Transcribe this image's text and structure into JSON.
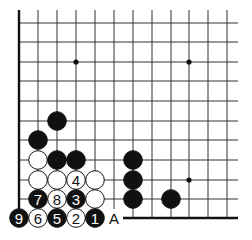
{
  "diagram": {
    "type": "go-board-corner",
    "grid": {
      "x": [
        19,
        38,
        57,
        76,
        95,
        114,
        133,
        152,
        171,
        189,
        208,
        227
      ],
      "y": [
        23,
        42,
        62,
        81,
        101,
        121,
        140,
        160,
        180,
        199,
        218
      ],
      "right_extent": 238,
      "top_extent": 10,
      "left_edge": true,
      "bottom_edge_from_x": 123
    },
    "hoshi": [
      {
        "col": 3,
        "row": 2
      },
      {
        "col": 9,
        "row": 2
      },
      {
        "col": 9,
        "row": 8
      }
    ],
    "stones": [
      {
        "col": 2,
        "row": 5,
        "color": "black",
        "label": ""
      },
      {
        "col": 1,
        "row": 6,
        "color": "black",
        "label": ""
      },
      {
        "col": 1,
        "row": 7,
        "color": "white",
        "label": ""
      },
      {
        "col": 2,
        "row": 7,
        "color": "black",
        "label": ""
      },
      {
        "col": 3,
        "row": 7,
        "color": "black",
        "label": ""
      },
      {
        "col": 6,
        "row": 7,
        "color": "black",
        "label": ""
      },
      {
        "col": 1,
        "row": 8,
        "color": "white",
        "label": ""
      },
      {
        "col": 2,
        "row": 8,
        "color": "white",
        "label": ""
      },
      {
        "col": 3,
        "row": 8,
        "color": "white",
        "label": "4"
      },
      {
        "col": 4,
        "row": 8,
        "color": "white",
        "label": ""
      },
      {
        "col": 6,
        "row": 8,
        "color": "black",
        "label": ""
      },
      {
        "col": 1,
        "row": 9,
        "color": "black",
        "label": "7"
      },
      {
        "col": 2,
        "row": 9,
        "color": "white",
        "label": "8"
      },
      {
        "col": 3,
        "row": 9,
        "color": "black",
        "label": "3"
      },
      {
        "col": 4,
        "row": 9,
        "color": "white",
        "label": ""
      },
      {
        "col": 6,
        "row": 9,
        "color": "black",
        "label": ""
      },
      {
        "col": 8,
        "row": 9,
        "color": "black",
        "label": ""
      },
      {
        "col": 0,
        "row": 10,
        "color": "black",
        "label": "9"
      },
      {
        "col": 1,
        "row": 10,
        "color": "white",
        "label": "6"
      },
      {
        "col": 2,
        "row": 10,
        "color": "black",
        "label": "5"
      },
      {
        "col": 3,
        "row": 10,
        "color": "white",
        "label": "2"
      },
      {
        "col": 4,
        "row": 10,
        "color": "black",
        "label": "1"
      }
    ],
    "markers": [
      {
        "col": 5,
        "row": 10,
        "label": "A"
      }
    ],
    "colors": {
      "line": "#333333",
      "black_stone": "#111111",
      "white_stone": "#ffffff",
      "stone_outline": "#111111"
    }
  }
}
